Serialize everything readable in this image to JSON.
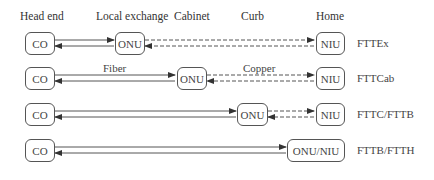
{
  "headers": {
    "head_end": "Head end",
    "local_exchange": "Local exchange",
    "cabinet": "Cabinet",
    "curb": "Curb",
    "home": "Home"
  },
  "media_labels": {
    "fiber": "Fiber",
    "copper": "Copper"
  },
  "rows": [
    {
      "name": "FTTEx",
      "nodes": [
        "CO",
        "ONU",
        "NIU"
      ],
      "fiber_span": "CO-ONU",
      "copper_span": "ONU-NIU"
    },
    {
      "name": "FTTCab",
      "nodes": [
        "CO",
        "ONU",
        "NIU"
      ],
      "fiber_span": "CO-ONU",
      "copper_span": "ONU-NIU"
    },
    {
      "name": "FTTC/FTTB",
      "nodes": [
        "CO",
        "ONU",
        "NIU"
      ],
      "fiber_span": "CO-ONU",
      "copper_span": "ONU-NIU"
    },
    {
      "name": "FTTB/FTTH",
      "nodes": [
        "CO",
        "ONU/NIU"
      ],
      "fiber_span": "CO-ONU/NIU"
    }
  ],
  "colors": {
    "line": "#444444",
    "box_border": "#555555",
    "text": "#333333"
  }
}
